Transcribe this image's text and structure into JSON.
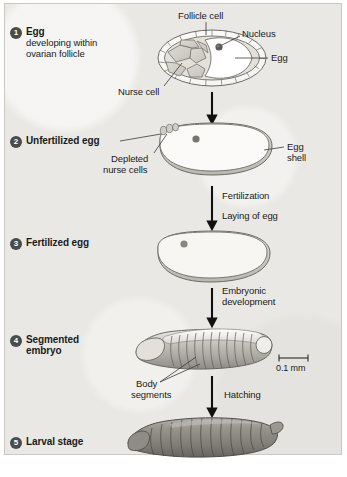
{
  "figure": {
    "background_color": "#e9e8e4",
    "ink_color": "#1b1b1b"
  },
  "stages": [
    {
      "number": "1",
      "title": "Egg",
      "subtitle_line1": "developing within",
      "subtitle_line2": "ovarian follicle"
    },
    {
      "number": "2",
      "title": "Unfertilized egg",
      "subtitle_line1": "",
      "subtitle_line2": ""
    },
    {
      "number": "3",
      "title": "Fertilized egg",
      "subtitle_line1": "",
      "subtitle_line2": ""
    },
    {
      "number": "4",
      "title": "Segmented",
      "subtitle_line1": "embryo",
      "subtitle_line2": ""
    },
    {
      "number": "5",
      "title": "Larval stage",
      "subtitle_line1": "",
      "subtitle_line2": ""
    }
  ],
  "callouts": {
    "follicle_cell": "Follicle cell",
    "nucleus": "Nucleus",
    "egg": "Egg",
    "nurse_cell": "Nurse cell",
    "depleted_nurse_cells_line1": "Depleted",
    "depleted_nurse_cells_line2": "nurse cells",
    "egg_shell_line1": "Egg",
    "egg_shell_line2": "shell",
    "body_segments_line1": "Body",
    "body_segments_line2": "segments"
  },
  "processes": {
    "fertilization": "Fertilization",
    "laying_of_egg": "Laying of egg",
    "embryonic_line1": "Embryonic",
    "embryonic_line2": "development",
    "hatching": "Hatching"
  },
  "scale_bar": {
    "length_label": "0.1 mm"
  }
}
